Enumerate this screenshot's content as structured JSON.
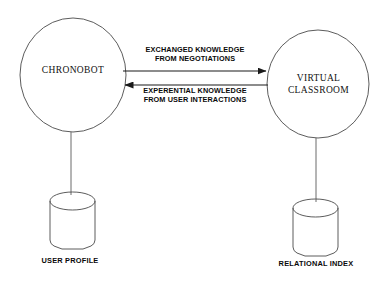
{
  "diagram": {
    "background_color": "#ffffff",
    "stroke_color": "#3a3a3a",
    "text_color": "#0a0a0a",
    "nodes": [
      {
        "id": "chronobot",
        "shape": "ellipse",
        "label": "CHRONOBOT",
        "cx": 73,
        "cy": 75,
        "rx": 53,
        "ry": 57
      },
      {
        "id": "virtual-classroom",
        "shape": "ellipse",
        "label": "VIRTUAL\nCLASSROOM",
        "cx": 318,
        "cy": 84,
        "rx": 51,
        "ry": 54
      }
    ],
    "datastores": [
      {
        "id": "user-profile",
        "shape": "cylinder",
        "label": "USER PROFILE",
        "x": 50,
        "y": 192,
        "width": 45,
        "height": 57
      },
      {
        "id": "relational-index",
        "shape": "cylinder",
        "label": "RELATIONAL INDEX",
        "x": 293,
        "y": 199,
        "width": 45,
        "height": 57
      }
    ],
    "edges": [
      {
        "id": "exchanged-knowledge",
        "label": "EXCHANGED KNOWLEDGE\nFROM NEGOTIATIONS",
        "from": "chronobot",
        "to": "virtual-classroom",
        "direction": "right",
        "x1": 123,
        "x2": 268,
        "y": 71
      },
      {
        "id": "experential-knowledge",
        "label": "EXPERENTIAL KNOWLEDGE\nFROM USER INTERACTIONS",
        "from": "virtual-classroom",
        "to": "chronobot",
        "direction": "left",
        "x1": 268,
        "x2": 122,
        "y": 85
      }
    ],
    "connectors": [
      {
        "id": "chronobot-to-user-profile",
        "x": 71,
        "y1": 132,
        "y2": 193
      },
      {
        "id": "virtual-classroom-to-relational-index",
        "x": 316,
        "y1": 138,
        "y2": 200
      }
    ]
  }
}
